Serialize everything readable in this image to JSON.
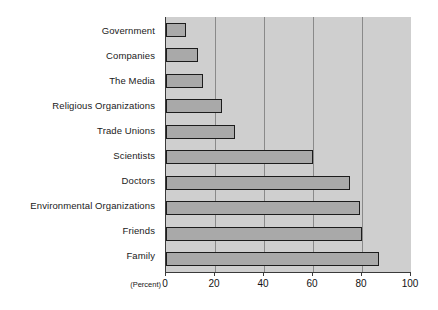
{
  "chart_data": {
    "type": "bar",
    "orientation": "horizontal",
    "title": "",
    "subtitle": "",
    "xlabel": "(Percent)",
    "ylabel": "",
    "categories": [
      "Government",
      "Companies",
      "The Media",
      "Religious Organizations",
      "Trade Unions",
      "Scientists",
      "Doctors",
      "Environmental Organizations",
      "Friends",
      "Family"
    ],
    "values": [
      8,
      13,
      15,
      23,
      28,
      60,
      75,
      79,
      80,
      87
    ],
    "xlim": [
      0,
      100
    ],
    "xticks": [
      0,
      20,
      40,
      60,
      80,
      100
    ],
    "xtick_labels": [
      "0",
      "20",
      "40",
      "60",
      "80",
      "100"
    ],
    "gridlines": [
      20,
      40,
      60,
      80
    ],
    "grid": true,
    "legend": null,
    "legend_position": "none",
    "annotations": [],
    "colors": {
      "plot_background": "#cfcfcf",
      "bar_fill": "#a9a9a9",
      "bar_border": "#1c1c1c",
      "gridline": "#8a8a8a",
      "axis": "#3a3a3a",
      "text": "#121212",
      "page_background": "#ffffff"
    }
  }
}
